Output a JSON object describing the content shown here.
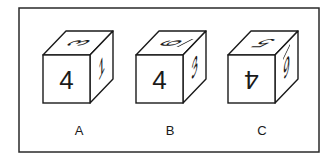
{
  "figure": {
    "frame": {
      "x": 19,
      "y": 8,
      "w": 300,
      "h": 144,
      "stroke": "#2a2a2a"
    },
    "stroke_color": "#1a1a1a",
    "cubes": [
      {
        "label": "A",
        "front": "4",
        "front_rotate": 0,
        "top": "3",
        "top_rotate": -90,
        "right": "1",
        "right_rotate": 0
      },
      {
        "label": "B",
        "front": "4",
        "front_rotate": 0,
        "top": "9",
        "top_rotate": 90,
        "top_bar": true,
        "right": "3",
        "right_rotate": 0
      },
      {
        "label": "C",
        "front": "4",
        "front_rotate": 180,
        "top": "5",
        "top_rotate": 180,
        "right": "9",
        "right_rotate": 0,
        "right_bar": true
      }
    ]
  }
}
